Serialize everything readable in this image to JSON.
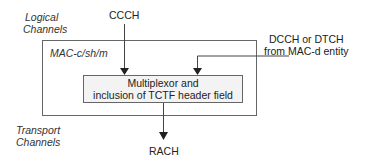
{
  "diagram": {
    "labels": {
      "logical_channels": [
        "Logical",
        "Channels"
      ],
      "transport_channels": [
        "Transport",
        "Channels"
      ],
      "mac_entity": "MAC-c/sh/m",
      "ccch": "CCCH",
      "dcch_dtch": [
        "DCCH or DTCH",
        "from MAC-d entity"
      ],
      "rach": "RACH"
    },
    "process_box": {
      "lines": [
        "Multiplexor and",
        "inclusion of TCTF header field"
      ]
    },
    "edges": [
      {
        "from": "CCCH",
        "to": "Multiplexor"
      },
      {
        "from": "DCCH or DTCH from MAC-d entity",
        "to": "Multiplexor"
      },
      {
        "from": "Multiplexor",
        "to": "RACH"
      }
    ],
    "colors": {
      "line": "#444444",
      "box_fill": "#f3f3f3"
    }
  }
}
